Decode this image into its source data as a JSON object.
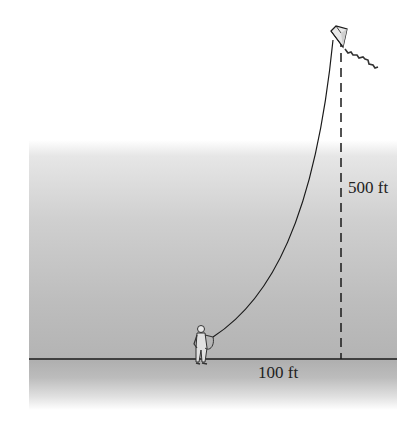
{
  "figure": {
    "labels": {
      "height": "500 ft",
      "horizontal_distance": "100 ft"
    },
    "colors": {
      "line": "#1a1a1a",
      "ground_gradient_top": "#e6e6e6",
      "ground_gradient_bottom": "#b0b0b0"
    }
  }
}
